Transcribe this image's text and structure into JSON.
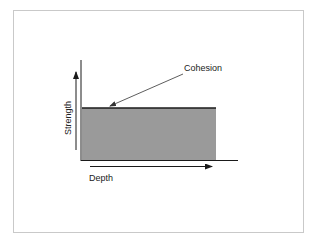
{
  "diagram": {
    "title_annotation": "Cohesion",
    "y_axis_label": "Strength",
    "x_axis_label": "Depth",
    "colors": {
      "fill": "#9a9a9a",
      "line": "#1a1a1a",
      "frame": "#c9c9c9",
      "text": "#222222"
    }
  }
}
